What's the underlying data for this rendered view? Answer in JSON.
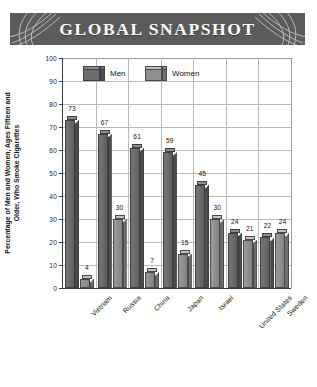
{
  "banner": {
    "title": "GLOBAL SNAPSHOT",
    "background_color": "#5b5b5b",
    "text_color": "#ffffff",
    "left_ornament": "arc-swirl-ornament",
    "right_ornament": "arc-swirl-ornament"
  },
  "chart_data": {
    "type": "bar",
    "title": "GLOBAL SNAPSHOT",
    "xlabel": "",
    "ylabel": "Percentage of Men and Women, Ages Fifteen and Older, Who Smoke Cigarettes",
    "ylabel_line1": "Percentage of Men and Women, Ages Fifteen and",
    "ylabel_line2": "Older, Who Smoke Cigarettes",
    "ylim": [
      0,
      100
    ],
    "yticks": [
      0,
      10,
      20,
      30,
      40,
      50,
      60,
      70,
      80,
      90,
      100
    ],
    "grid": true,
    "legend_position": "top-left-inside",
    "categories": [
      "Vietnam",
      "Russia",
      "China",
      "Japan",
      "Israel",
      "United States",
      "Sweden"
    ],
    "series": [
      {
        "name": "Men",
        "color": "#6d6d6d",
        "values": [
          73,
          67,
          61,
          59,
          45,
          24,
          22
        ]
      },
      {
        "name": "Women",
        "color": "#8e8e8e",
        "values": [
          4,
          30,
          7,
          15,
          30,
          21,
          24
        ]
      }
    ]
  }
}
